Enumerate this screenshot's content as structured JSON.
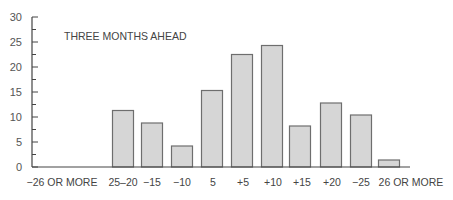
{
  "chart_data": {
    "type": "bar",
    "title": "THREE MONTHS AHEAD",
    "xlabel": "",
    "ylabel": "",
    "ylim": [
      0,
      30
    ],
    "yticks": [
      0,
      5,
      10,
      15,
      20,
      25,
      30
    ],
    "grid": false,
    "legend": null,
    "categories": [
      "−26 OR MORE",
      "25–20",
      "−15",
      "−10",
      "5",
      "+5",
      "+10",
      "+15",
      "+20",
      "−25",
      "26 OR MORE"
    ],
    "values": [
      0,
      11.3,
      8.8,
      4.2,
      15.3,
      22.5,
      24.3,
      8.2,
      12.8,
      10.4,
      1.4
    ],
    "colors": {
      "bar_fill": "#d6d6d6",
      "bar_stroke": "#6e6e6e",
      "axis": "#444444"
    }
  }
}
